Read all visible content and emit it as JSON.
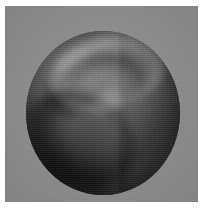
{
  "figure": {
    "title": "",
    "caption": "",
    "media_type": "grayscale-photograph",
    "alt_text": "Grayscale image of an illuminated spherical body showing a bright swirling arc across the upper hemisphere, a small bright vortex near the centre, a dark curved band sweeping through the lower left, and pronounced limb darkening around the edge, set on a flat gray background."
  },
  "plate": {
    "background_color": "#8d8d8d",
    "page_background_color": "#ffffff",
    "x": 5,
    "y": 6,
    "width": 193,
    "height": 196
  },
  "sphere": {
    "center_x": 103,
    "center_y": 108,
    "diameter": 154,
    "base_color": "#4a4a4a",
    "highlight_color": "#9a9a9a",
    "shadow_color": "#151515",
    "limb_darkening": true
  },
  "features": [
    {
      "name": "bright-upper-arc",
      "description": "bright swirling arc across the upper hemisphere",
      "tone": "light"
    },
    {
      "name": "dark-upper-arc",
      "description": "dark band bordering the bright upper arc",
      "tone": "dark"
    },
    {
      "name": "central-vortex",
      "description": "small bright vortex / eye near the centre",
      "tone": "light"
    },
    {
      "name": "vortex-tail",
      "description": "faint streak trailing from the central vortex",
      "tone": "light"
    },
    {
      "name": "dark-lower-arc",
      "description": "strong dark curved band sweeping the lower left",
      "tone": "dark"
    },
    {
      "name": "mid-grey-arc",
      "description": "mid-grey band below the dark lower arc",
      "tone": "mid"
    },
    {
      "name": "right-flank",
      "description": "faint lit flank on the right side of the disc",
      "tone": "mid"
    },
    {
      "name": "vertical-banding",
      "description": "vertical scan seam / banding across the disc",
      "tone": "mid"
    }
  ]
}
